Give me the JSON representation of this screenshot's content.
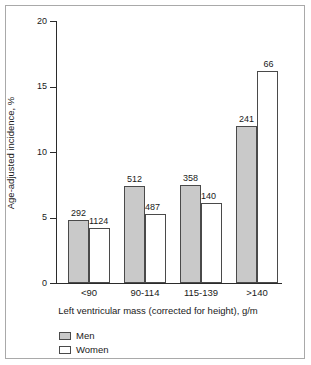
{
  "chart_data": {
    "type": "bar",
    "title": "",
    "subtitle": "",
    "xlabel": "Left ventricular mass (corrected for height), g/m",
    "ylabel": "Age-adjusted incidence, %",
    "categories": [
      "<90",
      "90-114",
      "115-139",
      ">140"
    ],
    "ylim": [
      0,
      20
    ],
    "yticks": [
      0,
      5,
      10,
      15,
      20
    ],
    "ytick_labels": [
      "0",
      "5",
      "10",
      "15",
      "20"
    ],
    "grid": false,
    "legend_position": "bottom-left",
    "series": [
      {
        "name": "Men",
        "color": "#c9c9c9",
        "values": [
          4.8,
          7.4,
          7.5,
          12.0
        ],
        "point_labels": [
          "292",
          "512",
          "358",
          "241"
        ]
      },
      {
        "name": "Women",
        "color": "#ffffff",
        "values": [
          4.2,
          5.3,
          6.1,
          16.2
        ],
        "point_labels": [
          "1124",
          "487",
          "140",
          "66"
        ]
      }
    ]
  },
  "axes": {
    "y_title": "Age-adjusted incidence, %",
    "x_title": "Left ventricular mass (corrected for height), g/m",
    "y_tick_labels": [
      "20",
      "15",
      "10",
      "5",
      "0"
    ],
    "x_tick_labels": [
      "<90",
      "90-114",
      "115-139",
      ">140"
    ]
  },
  "legend": {
    "items": [
      {
        "label": "Men",
        "color": "#c9c9c9"
      },
      {
        "label": "Women",
        "color": "#ffffff"
      }
    ]
  },
  "bar_labels": {
    "men": [
      "292",
      "512",
      "358",
      "241"
    ],
    "women": [
      "1124",
      "487",
      "140",
      "66"
    ]
  }
}
